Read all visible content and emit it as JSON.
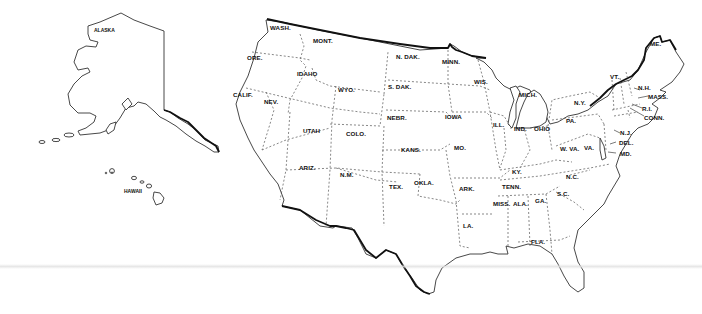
{
  "map": {
    "title": "United States outline map",
    "labels": {
      "alaska": "ALASKA",
      "hawaii": "HAWAII",
      "wash": "WASH.",
      "ore": "ORE.",
      "calif": "CALIF.",
      "idaho": "IDAHO",
      "nev": "NEV.",
      "mont": "MONT.",
      "wyo": "WYO.",
      "utah": "UTAH",
      "ariz": "ARIZ.",
      "colo": "COLO.",
      "nm": "N.M.",
      "ndak": "N. DAK.",
      "sdak": "S. DAK.",
      "nebr": "NEBR.",
      "kans": "KANS.",
      "okla": "OKLA.",
      "tex": "TEX.",
      "minn": "MINN.",
      "iowa": "IOWA",
      "mo": "MO.",
      "ark": "ARK.",
      "la": "LA.",
      "wis": "WIS.",
      "ill": "ILL.",
      "mich": "MICH.",
      "ind": "IND.",
      "ohio": "OHIO",
      "ky": "KY.",
      "tenn": "TENN.",
      "miss": "MISS.",
      "ala": "ALA.",
      "ga": "GA.",
      "fla": "FLA.",
      "sc": "S.C.",
      "nc": "N.C.",
      "va": "VA.",
      "wva": "W. VA.",
      "pa": "PA.",
      "ny": "N.Y.",
      "vt": "VT.",
      "nh": "N.H.",
      "me": "ME.",
      "mass": "MASS.",
      "ri": "R.I.",
      "conn": "CONN.",
      "nj": "N.J.",
      "del": "DEL.",
      "md": "MD."
    },
    "colors": {
      "background": "#ffffff",
      "outline": "#333333",
      "international_border": "#111111",
      "label": "#111111"
    }
  }
}
